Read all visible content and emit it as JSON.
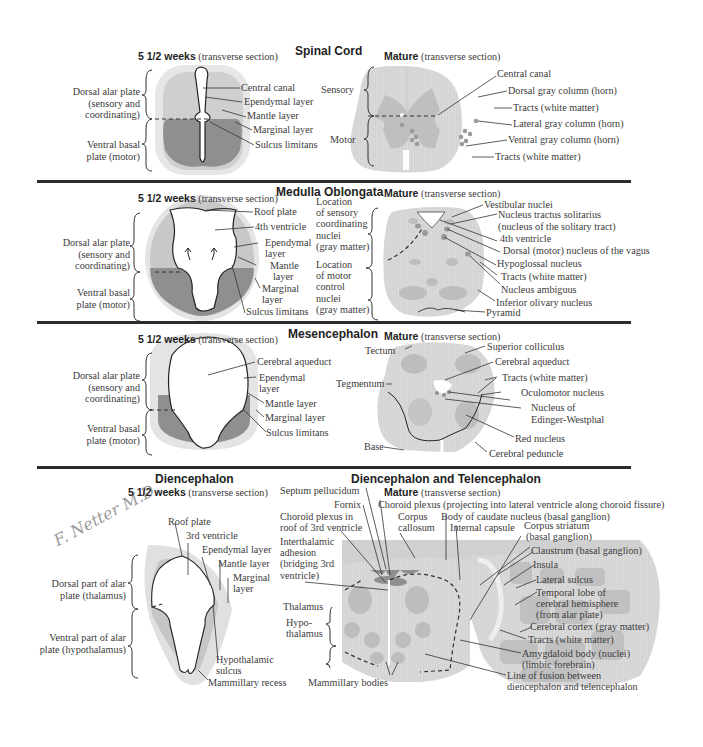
{
  "sections": {
    "spinal_cord": {
      "title": "Spinal Cord",
      "embryo": {
        "subtitle_bold": "5 1/2 weeks",
        "subtitle_rest": " (transverse section)",
        "left_labels": [
          "Dorsal alar plate",
          "(sensory and",
          "coordinating)",
          "Ventral basal",
          "plate (motor)"
        ],
        "right_labels": [
          "Central canal",
          "Ependymal layer",
          "Mantle layer",
          "Marginal layer",
          "Sulcus limitans"
        ]
      },
      "mature": {
        "subtitle_bold": "Mature",
        "subtitle_rest": " (transverse section)",
        "left_labels": [
          "Sensory",
          "Motor"
        ],
        "right_labels": [
          "Central canal",
          "Dorsal gray column (horn)",
          "Tracts (white matter)",
          "Lateral gray column (horn)",
          "Ventral gray column (horn)",
          "Tracts (white matter)"
        ]
      }
    },
    "medulla": {
      "title": "Medulla Oblongata",
      "embryo": {
        "subtitle_bold": "5 1/2 weeks",
        "subtitle_rest": " (transverse section)",
        "left_labels": [
          "Dorsal alar plate",
          "(sensory and",
          "coordinating)",
          "Ventral basal",
          "plate (motor)"
        ],
        "right_labels": [
          "Roof plate",
          "4th ventricle",
          "Ependymal",
          "layer",
          "Mantle",
          "layer",
          "Marginal",
          "layer",
          "Sulcus limitans"
        ]
      },
      "middle_labels": [
        "Location",
        "of sensory",
        "coordinating",
        "nuclei",
        "(gray matter)",
        "Location",
        "of motor",
        "control",
        "nuclei",
        "(gray matter)"
      ],
      "mature": {
        "subtitle_bold": "Mature",
        "subtitle_rest": " (transverse section)",
        "right_labels": [
          "Vestibular nuclei",
          "Nucleus tractus solitarius",
          "(nucleus of the solitary tract)",
          "4th ventricle",
          "Dorsal (motor) nucleus of the vagus",
          "Hypoglossal nucleus",
          "Tracts (white matter)",
          "Nucleus ambiguus",
          "Inferior olivary nucleus",
          "Pyramid"
        ]
      }
    },
    "mesencephalon": {
      "title": "Mesencephalon",
      "embryo": {
        "subtitle_bold": "5 1/2 weeks",
        "subtitle_rest": " (transverse section)",
        "left_labels": [
          "Dorsal alar plate",
          "(sensory and",
          "coordinating)",
          "Ventral basal",
          "plate (motor)"
        ],
        "right_labels": [
          "Cerebral aqueduct",
          "Ependymal",
          "layer",
          "Mantle layer",
          "Marginal layer",
          "Sulcus limitans"
        ]
      },
      "mature": {
        "subtitle_bold": "Mature",
        "subtitle_rest": " (transverse section)",
        "left_labels": [
          "Tectum",
          "Tegmentum",
          "Base"
        ],
        "right_labels": [
          "Superior colliculus",
          "Cerebral aqueduct",
          "Tracts (white matter)",
          "Oculomotor nucleus",
          "Nucleus of",
          "Edinger-Westphal",
          "Red nucleus",
          "Cerebral peduncle"
        ]
      }
    },
    "diencephalon": {
      "title": "Diencephalon",
      "signature": "F. Netter M.D.",
      "embryo": {
        "subtitle_bold": "5 1/2 weeks",
        "subtitle_rest": " (transverse section)",
        "left_labels": [
          "Dorsal part of alar",
          "plate (thalamus)",
          "Ventral part of alar",
          "plate (hypothalamus)"
        ],
        "top_labels": [
          "Roof plate",
          "3rd ventricle",
          "Ependymal layer",
          "Mantle layer",
          "Marginal",
          "layer",
          "Hypothalamic",
          "sulcus",
          "Mammillary recess"
        ]
      }
    },
    "dien_telen": {
      "title": "Diencephalon and Telencephalon",
      "mature": {
        "subtitle_bold": "Mature",
        "subtitle_rest": " (transverse section)",
        "left_labels": [
          "Septum pellucidum",
          "Fornix",
          "Choroid plexus in",
          "roof of 3rd ventricle",
          "Interthalamic",
          "adhesion",
          "(bridging 3rd",
          "ventricle)",
          "Thalamus",
          "Hypo-",
          "thalamus",
          "Mammillary bodies"
        ],
        "top_labels": [
          "Choroid plexus (projecting into lateral ventricle along choroid fissure)",
          "Corpus",
          "callosum",
          "Body of caudate nucleus (basal ganglion)",
          "Internal capsule"
        ],
        "right_labels": [
          "Corpus striatum",
          "(basal ganglion)",
          "Claustrum (basal ganglion)",
          "Insula",
          "Lateral sulcus",
          "Temporal lobe of",
          "cerebral hemisphere",
          "(from alar plate)",
          "Cerebral cortex (gray matter)",
          "Tracts (white matter)",
          "Amygdaloid body (nuclei)",
          "(limbic forebrain)",
          "Line of fusion between",
          "diencephalon and telencephalon"
        ]
      }
    }
  },
  "colors": {
    "light_gray": "#dcdcdc",
    "mid_gray": "#bdbdbd",
    "dark_gray": "#8f8f8f",
    "line": "#2b2b2b",
    "text": "#3b3b3b"
  }
}
